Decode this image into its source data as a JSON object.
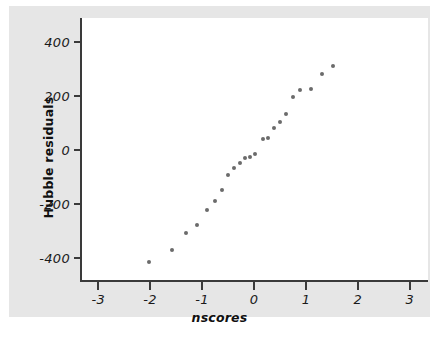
{
  "chart_data": {
    "type": "scatter",
    "title": "",
    "xlabel": "nscores",
    "ylabel": "Hubble residuals",
    "xlim": [
      -3.35,
      3.35
    ],
    "ylim": [
      -487,
      487
    ],
    "xticks": [
      -3,
      -2,
      -1,
      0,
      1,
      2,
      3
    ],
    "xticklabels": [
      "-3",
      "-2",
      "-1",
      "0",
      "1",
      "2",
      "3"
    ],
    "yticks": [
      -400,
      -200,
      0,
      200,
      400
    ],
    "yticklabels": [
      "-400",
      "-200",
      "0",
      "200",
      "400"
    ],
    "grid": false,
    "legend": null,
    "marker": "circle",
    "marker_color": "#6b6b6b",
    "series": [
      {
        "name": "Hubble residuals vs normal scores",
        "x": [
          -2.03,
          -1.58,
          -1.31,
          -1.09,
          -0.91,
          -0.76,
          -0.62,
          -0.5,
          -0.38,
          -0.27,
          -0.17,
          -0.08,
          0.0,
          0.08,
          0.17,
          0.27,
          0.38,
          0.5,
          0.62,
          0.76,
          0.91,
          1.09,
          1.31,
          1.58,
          2.03
        ],
        "y": [
          -413,
          -369,
          -305,
          -278,
          -222,
          -190,
          -146,
          -93,
          -68,
          -47,
          -30,
          -27,
          -13,
          40,
          45,
          83,
          105,
          133,
          196,
          222,
          226,
          280,
          310,
          310,
          310
        ]
      }
    ],
    "points": [
      {
        "x": -2.03,
        "y": -413
      },
      {
        "x": -1.58,
        "y": -369
      },
      {
        "x": -1.31,
        "y": -305
      },
      {
        "x": -1.09,
        "y": -278
      },
      {
        "x": -0.91,
        "y": -222
      },
      {
        "x": -0.76,
        "y": -190
      },
      {
        "x": -0.62,
        "y": -146
      },
      {
        "x": -0.5,
        "y": -93
      },
      {
        "x": -0.38,
        "y": -68
      },
      {
        "x": -0.27,
        "y": -47
      },
      {
        "x": -0.17,
        "y": -30
      },
      {
        "x": -0.08,
        "y": -27
      },
      {
        "x": 0.02,
        "y": -13
      },
      {
        "x": 0.17,
        "y": 40
      },
      {
        "x": 0.27,
        "y": 45
      },
      {
        "x": 0.38,
        "y": 83
      },
      {
        "x": 0.5,
        "y": 105
      },
      {
        "x": 0.62,
        "y": 133
      },
      {
        "x": 0.76,
        "y": 196
      },
      {
        "x": 0.88,
        "y": 222
      },
      {
        "x": 1.09,
        "y": 226
      },
      {
        "x": 1.31,
        "y": 280
      },
      {
        "x": 1.53,
        "y": 310
      }
    ]
  },
  "colors": {
    "figure_background": "#e6e6e6",
    "plot_background": "#ffffff",
    "axis": "#3a3a3a",
    "marker": "#6b6b6b",
    "text": "#101010"
  }
}
